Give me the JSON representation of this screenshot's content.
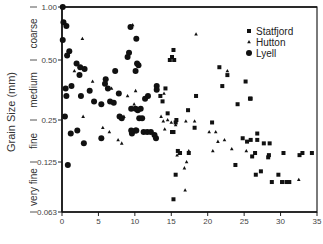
{
  "chart_data": {
    "type": "scatter",
    "title": "",
    "xlabel": "",
    "ylabel": "Grain Size (mm)",
    "y_scale": "log2",
    "xlim": [
      0,
      35
    ],
    "ylim": [
      0.063,
      1.0
    ],
    "grid": false,
    "legend_position": "upper right",
    "x_ticks": [
      0,
      5,
      10,
      15,
      20,
      25,
      30,
      35
    ],
    "y_ticks": [
      {
        "label": "1.00",
        "value": 1.0,
        "px": 7
      },
      {
        "label": "0.50",
        "value": 0.5,
        "px": 60
      },
      {
        "label": "0.25",
        "value": 0.25,
        "px": 120
      },
      {
        "label": "0.125",
        "value": 0.125,
        "px": 162
      },
      {
        "label": "0.063",
        "value": 0.063,
        "px": 212
      }
    ],
    "size_classes": [
      {
        "label": "coarse",
        "from": 1.0,
        "to": 0.5
      },
      {
        "label": "medium",
        "from": 0.5,
        "to": 0.25
      },
      {
        "label": "fine",
        "from": 0.25,
        "to": 0.125
      },
      {
        "label": "very fine",
        "from": 0.125,
        "to": 0.063
      }
    ],
    "legend": [
      {
        "name": "Statfjord",
        "marker": "square"
      },
      {
        "name": "Hutton",
        "marker": "triangle"
      },
      {
        "name": "Lyell",
        "marker": "circle"
      }
    ],
    "series": [
      {
        "name": "Statfjord",
        "marker": "square",
        "points": [
          [
            15.3,
            0.57
          ],
          [
            15.1,
            0.52
          ],
          [
            14.8,
            0.5
          ],
          [
            15.4,
            0.5
          ],
          [
            21.6,
            0.46
          ],
          [
            22.7,
            0.42
          ],
          [
            25.2,
            0.39
          ],
          [
            22.0,
            0.37
          ],
          [
            14.2,
            0.36
          ],
          [
            13.5,
            0.33
          ],
          [
            25.8,
            0.32
          ],
          [
            25.9,
            0.32
          ],
          [
            18.4,
            0.33
          ],
          [
            13.8,
            0.31
          ],
          [
            24.1,
            0.3
          ],
          [
            17.3,
            0.28
          ],
          [
            14.5,
            0.27
          ],
          [
            15.7,
            0.25
          ],
          [
            15.6,
            0.24
          ],
          [
            20.6,
            0.24
          ],
          [
            18.2,
            0.22
          ],
          [
            15.1,
            0.205
          ],
          [
            15.3,
            0.205
          ],
          [
            26.8,
            0.2
          ],
          [
            24.8,
            0.185
          ],
          [
            25.9,
            0.18
          ],
          [
            26.8,
            0.18
          ],
          [
            25.4,
            0.175
          ],
          [
            27.7,
            0.17
          ],
          [
            28.5,
            0.17
          ],
          [
            16.2,
            0.145
          ],
          [
            15.9,
            0.15
          ],
          [
            17.4,
            0.145
          ],
          [
            26.5,
            0.145
          ],
          [
            28.4,
            0.14
          ],
          [
            26.1,
            0.137
          ],
          [
            30.4,
            0.145
          ],
          [
            33.0,
            0.145
          ],
          [
            32.6,
            0.14
          ],
          [
            34.3,
            0.145
          ],
          [
            28.3,
            0.135
          ],
          [
            23.8,
            0.12
          ],
          [
            15.6,
            0.105
          ],
          [
            26.6,
            0.105
          ],
          [
            29.7,
            0.105
          ],
          [
            27.3,
            0.11
          ],
          [
            28.8,
            0.095
          ],
          [
            30.2,
            0.095
          ],
          [
            30.8,
            0.095
          ],
          [
            31.2,
            0.095
          ],
          [
            15.3,
            0.075
          ]
        ]
      },
      {
        "name": "Hutton",
        "marker": "triangle",
        "points": [
          [
            2.8,
            0.66
          ],
          [
            9.7,
            0.79
          ],
          [
            1.7,
            0.44
          ],
          [
            4.2,
            0.39
          ],
          [
            6.8,
            0.36
          ],
          [
            9.0,
            0.33
          ],
          [
            10.1,
            0.35
          ],
          [
            9.9,
            0.3
          ],
          [
            8.5,
            0.26
          ],
          [
            5.6,
            0.22
          ],
          [
            6.5,
            0.205
          ],
          [
            2.9,
            0.26
          ],
          [
            7.7,
            0.18
          ],
          [
            8.2,
            0.17
          ],
          [
            18.4,
            0.7
          ],
          [
            22.7,
            0.44
          ],
          [
            14.0,
            0.34
          ],
          [
            14.5,
            0.25
          ],
          [
            13.6,
            0.26
          ],
          [
            15.0,
            0.24
          ],
          [
            17.0,
            0.245
          ],
          [
            18.2,
            0.245
          ],
          [
            15.6,
            0.23
          ],
          [
            14.1,
            0.215
          ],
          [
            20.2,
            0.205
          ],
          [
            21.1,
            0.205
          ],
          [
            21.4,
            0.175
          ],
          [
            22.3,
            0.18
          ],
          [
            17.4,
            0.15
          ],
          [
            15.8,
            0.14
          ],
          [
            16.8,
            0.115
          ],
          [
            17.1,
            0.125
          ],
          [
            20.7,
            0.15
          ],
          [
            23.3,
            0.155
          ],
          [
            25.3,
            0.15
          ],
          [
            16.9,
            0.085
          ],
          [
            32.5,
            0.098
          ],
          [
            13.9,
            0.245
          ]
        ]
      },
      {
        "name": "Lyell",
        "marker": "circle",
        "points": [
          [
            0.1,
            1.0
          ],
          [
            0.2,
            0.82
          ],
          [
            0.6,
            0.78
          ],
          [
            0.1,
            0.65
          ],
          [
            1.0,
            0.56
          ],
          [
            0.7,
            0.53
          ],
          [
            2.0,
            0.48
          ],
          [
            2.5,
            0.46
          ],
          [
            3.1,
            0.45
          ],
          [
            2.4,
            0.42
          ],
          [
            0.5,
            0.36
          ],
          [
            0.6,
            0.33
          ],
          [
            1.3,
            0.37
          ],
          [
            2.6,
            0.33
          ],
          [
            3.8,
            0.35
          ],
          [
            0.4,
            0.26
          ],
          [
            2.1,
            0.21
          ],
          [
            1.2,
            0.2
          ],
          [
            3.0,
            0.17
          ],
          [
            0.8,
            0.12
          ],
          [
            9.4,
            0.77
          ],
          [
            10.2,
            0.66
          ],
          [
            9.2,
            0.55
          ],
          [
            9.0,
            0.52
          ],
          [
            10.3,
            0.48
          ],
          [
            10.5,
            0.47
          ],
          [
            7.3,
            0.44
          ],
          [
            10.1,
            0.44
          ],
          [
            6.0,
            0.4
          ],
          [
            6.3,
            0.36
          ],
          [
            5.9,
            0.38
          ],
          [
            7.8,
            0.34
          ],
          [
            6.6,
            0.31
          ],
          [
            5.4,
            0.3
          ],
          [
            4.4,
            0.31
          ],
          [
            7.1,
            0.305
          ],
          [
            10.1,
            0.285
          ],
          [
            10.4,
            0.28
          ],
          [
            10.8,
            0.285
          ],
          [
            9.5,
            0.285
          ],
          [
            8.2,
            0.255
          ],
          [
            7.9,
            0.26
          ],
          [
            10.6,
            0.255
          ],
          [
            9.6,
            0.2
          ],
          [
            10.1,
            0.21
          ],
          [
            10.2,
            0.21
          ],
          [
            11.2,
            0.205
          ],
          [
            5.4,
            0.185
          ],
          [
            11.7,
            0.205
          ],
          [
            9.5,
            0.21
          ],
          [
            12.2,
            0.205
          ],
          [
            12.7,
            0.195
          ],
          [
            13.0,
            0.37
          ],
          [
            13.0,
            0.355
          ],
          [
            11.8,
            0.33
          ],
          [
            11.4,
            0.32
          ],
          [
            12.9,
            0.185
          ],
          [
            11.0,
            0.255
          ]
        ]
      }
    ]
  }
}
